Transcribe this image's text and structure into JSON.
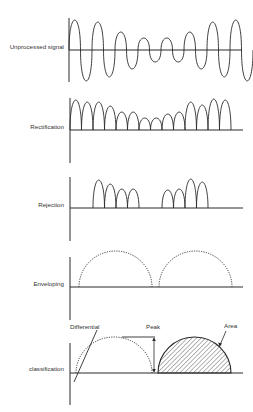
{
  "figure": {
    "colors": {
      "line": "#2a2a2a",
      "background": "#ffffff"
    },
    "panels": [
      {
        "id": "unprocessed",
        "label": "Unprocessed signal",
        "label_y": 47,
        "axis_x": 69,
        "axis_top": 18,
        "axis_bottom": 82,
        "baseline_y": 50,
        "baseline_end": 242,
        "type": "wave",
        "wave": {
          "x_start": 69,
          "half_period": 11.5,
          "amplitudes": [
            30,
            -31,
            28,
            -27,
            18,
            -19,
            12,
            -12,
            12,
            -12,
            18,
            -19,
            28,
            -27,
            30,
            -31
          ]
        }
      },
      {
        "id": "rectification",
        "label": "Rectification",
        "label_y": 127,
        "axis_x": 70,
        "axis_top": 98,
        "axis_bottom": 163,
        "baseline_y": 130,
        "baseline_end": 243,
        "type": "humps",
        "humps": {
          "x_start": 70,
          "width": 11.5,
          "heights": [
            30,
            28,
            28,
            24,
            18,
            18,
            12,
            12,
            16,
            18,
            28,
            25,
            31,
            30
          ]
        }
      },
      {
        "id": "rejection",
        "label": "Rejection",
        "label_y": 205,
        "axis_x": 70,
        "axis_top": 177,
        "axis_bottom": 241,
        "baseline_y": 208,
        "baseline_end": 243,
        "type": "humps_groups",
        "groups": [
          {
            "x_start": 93,
            "width": 11.5,
            "heights": [
              28,
              24,
              19,
              19
            ]
          },
          {
            "x_start": 162,
            "width": 11.5,
            "heights": [
              18,
              19,
              29,
              26
            ]
          }
        ]
      },
      {
        "id": "enveloping",
        "label": "Enveloping",
        "label_y": 284,
        "axis_x": 70,
        "axis_top": 257,
        "axis_bottom": 320,
        "baseline_y": 287,
        "baseline_end": 243,
        "type": "envelope",
        "arches": [
          {
            "x0": 79,
            "x1": 152,
            "height": 36
          },
          {
            "x0": 159,
            "x1": 232,
            "height": 36
          }
        ]
      },
      {
        "id": "classification",
        "label": "classification",
        "label_y": 369,
        "axis_x": 70,
        "axis_top": 343,
        "axis_bottom": 405,
        "baseline_y": 373,
        "baseline_end": 243,
        "type": "classification",
        "dotted_arch": {
          "x0": 76,
          "x1": 152,
          "height": 36
        },
        "area_arch": {
          "x0": 158,
          "x1": 231,
          "height": 36
        },
        "differential_line": {
          "x1": 74,
          "y1": 382,
          "x2": 97,
          "y2": 330
        },
        "peak": {
          "line_x1": 122,
          "line_x2": 155,
          "top_y": 337,
          "arrow_x": 154
        },
        "annotations": {
          "differential": {
            "text": "Differential",
            "x": 70,
            "y": 326
          },
          "peak": {
            "text": "Peak",
            "x": 145,
            "y": 326
          },
          "area": {
            "text": "Area",
            "x": 223,
            "y": 325
          }
        }
      }
    ]
  }
}
